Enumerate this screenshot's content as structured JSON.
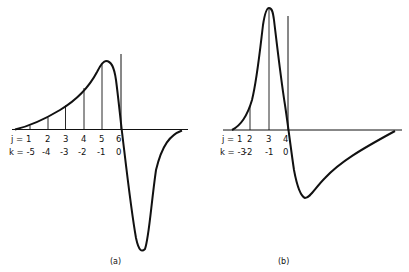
{
  "figure": {
    "panels": [
      {
        "id": "a",
        "caption": "(a)",
        "j_row": [
          "j = 1",
          "2",
          "3",
          "4",
          "5",
          "6"
        ],
        "k_row": [
          "k = -5",
          "-4",
          "-3",
          "-2",
          "-1",
          "0"
        ]
      },
      {
        "id": "b",
        "caption": "(b)",
        "j_row": [
          "j = 1",
          "2",
          "3",
          "4"
        ],
        "k_row": [
          "k = -3",
          "-2",
          "-1",
          "0"
        ]
      }
    ]
  },
  "colors": {
    "ink": "#111111",
    "background": "#ffffff"
  }
}
